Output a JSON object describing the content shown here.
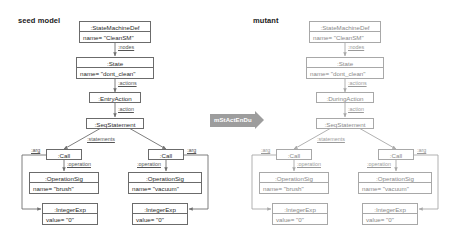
{
  "figure": {
    "panels": [
      {
        "id": "seed",
        "title": "seed model",
        "nodes": [
          {
            "id": "smd",
            "type": ":StateMachineDef",
            "attr": "name= \"CleanSM\""
          },
          {
            "id": "state",
            "type": ":State",
            "attr": "name= \"dont_clean\""
          },
          {
            "id": "act",
            "type": ":EntryAction",
            "attr": ""
          },
          {
            "id": "seq",
            "type": ":SeqStatement",
            "attr": ""
          },
          {
            "id": "call1",
            "type": ":Call",
            "attr": ""
          },
          {
            "id": "call2",
            "type": ":Call",
            "attr": ""
          },
          {
            "id": "op1",
            "type": ":OperationSig",
            "attr": "name= \"brush\""
          },
          {
            "id": "op2",
            "type": ":OperationSig",
            "attr": "name= \"vacuum\""
          },
          {
            "id": "int1",
            "type": ":IntegerExp",
            "attr": "value= \"0\""
          },
          {
            "id": "int2",
            "type": ":IntegerExp",
            "attr": "value= \"0\""
          }
        ],
        "edges": [
          {
            "id": "e-nodes",
            "label": ":nodes"
          },
          {
            "id": "e-actions",
            "label": ":actions"
          },
          {
            "id": "e-action",
            "label": ":action"
          },
          {
            "id": "e-statements",
            "label": ":statements"
          },
          {
            "id": "e-oper1",
            "label": ":operation"
          },
          {
            "id": "e-oper2",
            "label": ":operation"
          },
          {
            "id": "e-arg1",
            "label": ":arg"
          },
          {
            "id": "e-arg2",
            "label": ":arg"
          }
        ]
      },
      {
        "id": "mutant",
        "title": "mutant",
        "nodes": [
          {
            "id": "smd",
            "type": ":StateMachineDef",
            "attr": "name= \"CleanSM\""
          },
          {
            "id": "state",
            "type": ":State",
            "attr": "name= \"dont_clean\""
          },
          {
            "id": "act",
            "type": ":DuringAction",
            "attr": ""
          },
          {
            "id": "seq",
            "type": ":SeqStatement",
            "attr": ""
          },
          {
            "id": "call1",
            "type": ":Call",
            "attr": ""
          },
          {
            "id": "call2",
            "type": ":Call",
            "attr": ""
          },
          {
            "id": "op1",
            "type": ":OperationSig",
            "attr": "name= \"brush\""
          },
          {
            "id": "op2",
            "type": ":OperationSig",
            "attr": "name= \"vacuum\""
          },
          {
            "id": "int1",
            "type": ":IntegerExp",
            "attr": "value= \"0\""
          },
          {
            "id": "int2",
            "type": ":IntegerExp",
            "attr": "value= \"0\""
          }
        ],
        "edges": [
          {
            "id": "e-nodes",
            "label": ":nodes"
          },
          {
            "id": "e-actions",
            "label": ":actions"
          },
          {
            "id": "e-action",
            "label": ":action"
          },
          {
            "id": "e-statements",
            "label": ":statements"
          },
          {
            "id": "e-oper1",
            "label": ":operation"
          },
          {
            "id": "e-oper2",
            "label": ":operation"
          },
          {
            "id": "e-arg1",
            "label": ":arg"
          },
          {
            "id": "e-arg2",
            "label": ":arg"
          }
        ]
      }
    ],
    "mutation_arrow": {
      "label": "mStActEnDu"
    },
    "colors": {
      "box_border": "#6b6b6b",
      "box_border_faded": "#a8a8a8",
      "text": "#2b2b2b",
      "text_faded": "#8a8a8a",
      "arrow_fill": "#9d9d9d",
      "edge": "#6f6f6f"
    }
  }
}
